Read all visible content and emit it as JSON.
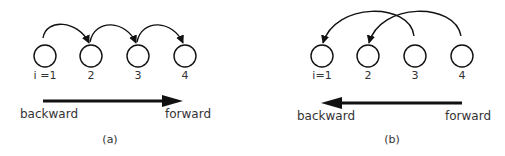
{
  "panels": [
    {
      "id": "a",
      "caption": "(a)",
      "nodes": [
        "i =1",
        "2",
        "3",
        "4"
      ],
      "arrows": [
        {
          "from": "i =1",
          "to": "2"
        },
        {
          "from": "2",
          "to": "3"
        },
        {
          "from": "3",
          "to": "4"
        }
      ],
      "direction_arrow": "left-to-right",
      "left_label": "backward",
      "right_label": "forward"
    },
    {
      "id": "b",
      "caption": "(b)",
      "nodes": [
        "i=1",
        "2",
        "3",
        "4"
      ],
      "arrows": [
        {
          "from": "3",
          "to": "i=1"
        },
        {
          "from": "4",
          "to": "2"
        }
      ],
      "direction_arrow": "right-to-left",
      "left_label": "backward",
      "right_label": "forward"
    }
  ]
}
